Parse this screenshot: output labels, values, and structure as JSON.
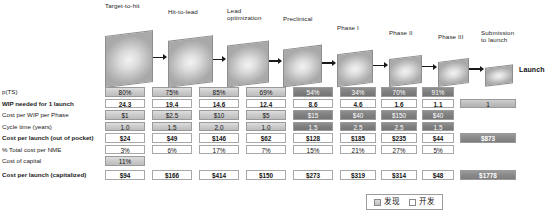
{
  "pipeline": {
    "stages": [
      {
        "label": "Target-to-hit"
      },
      {
        "label": "Hit-to-lead"
      },
      {
        "label": "Lead\noptimization"
      },
      {
        "label": "Preclinical"
      },
      {
        "label": "Phase I"
      },
      {
        "label": "Phase II"
      },
      {
        "label": "Phase III"
      },
      {
        "label": "Submission\nto launch"
      }
    ],
    "launch_label": "Launch"
  },
  "table": {
    "row_labels": [
      "p(TS)",
      "WIP needed for 1 launch",
      "Cost per WIP per Phase",
      "Cycle time (years)",
      "Cost per launch (out of pocket)",
      "% Total cost per NME",
      "Cost of capital",
      "Cost per launch (capitalized)"
    ],
    "rows": [
      {
        "label": "p(TS)",
        "bold": false,
        "values": [
          "80%",
          "75%",
          "85%",
          "69%",
          "54%",
          "34%",
          "70%",
          "91%"
        ],
        "styles": [
          "light",
          "light",
          "light",
          "light",
          "dark",
          "dark",
          "dark",
          "dark"
        ],
        "total": null,
        "total_style": null
      },
      {
        "label": "WIP needed for 1 launch",
        "bold": true,
        "values": [
          "24.3",
          "19.4",
          "14.6",
          "12.4",
          "8.6",
          "4.6",
          "1.6",
          "1.1"
        ],
        "styles": [
          "plain",
          "plain",
          "plain",
          "plain",
          "plain",
          "plain",
          "plain",
          "plain"
        ],
        "total": "1",
        "total_style": "totallight"
      },
      {
        "label": "Cost per WIP per Phase",
        "bold": false,
        "values": [
          "$1",
          "$2.5",
          "$10",
          "$5",
          "$15",
          "$40",
          "$150",
          "$40"
        ],
        "styles": [
          "light",
          "light",
          "light",
          "light",
          "dark",
          "dark",
          "dark",
          "dark"
        ],
        "total": null,
        "total_style": null
      },
      {
        "label": "Cycle time (years)",
        "bold": false,
        "values": [
          "1.0",
          "1.5",
          "2.0",
          "1.0",
          "1.5",
          "2.5",
          "2.5",
          "1.5"
        ],
        "styles": [
          "light",
          "light",
          "light",
          "light",
          "dark",
          "dark",
          "dark",
          "dark"
        ],
        "total": null,
        "total_style": null
      },
      {
        "label": "Cost per launch (out of pocket)",
        "bold": true,
        "values": [
          "$24",
          "$49",
          "$146",
          "$62",
          "$128",
          "$185",
          "$235",
          "$44"
        ],
        "styles": [
          "plain",
          "plain",
          "plain",
          "plain",
          "plain",
          "plain",
          "plain",
          "plain"
        ],
        "total": "$873",
        "total_style": "total"
      },
      {
        "label": "% Total cost per NME",
        "bold": false,
        "values": [
          "3%",
          "6%",
          "17%",
          "7%",
          "15%",
          "21%",
          "27%",
          "5%"
        ],
        "styles": [
          "plain",
          "plain",
          "plain",
          "plain",
          "plain",
          "plain",
          "plain",
          "plain"
        ],
        "total": null,
        "total_style": null
      },
      {
        "label": "Cost of capital",
        "bold": false,
        "values": [
          "11%",
          "",
          "",
          "",
          "",
          "",
          "",
          ""
        ],
        "styles": [
          "light",
          "none",
          "none",
          "none",
          "none",
          "none",
          "none",
          "none"
        ],
        "total": null,
        "total_style": null
      },
      {
        "label": "Cost per launch (capitalized)",
        "bold": true,
        "values": [
          "$94",
          "$166",
          "$414",
          "$150",
          "$273",
          "$319",
          "$314",
          "$48"
        ],
        "styles": [
          "plain",
          "plain",
          "plain",
          "plain",
          "plain",
          "plain",
          "plain",
          "plain"
        ],
        "total": "$1778",
        "total_style": "total"
      }
    ]
  },
  "legend": {
    "items": [
      {
        "label": "发现",
        "swatch": "disc"
      },
      {
        "label": "开发",
        "swatch": "dev"
      }
    ]
  }
}
